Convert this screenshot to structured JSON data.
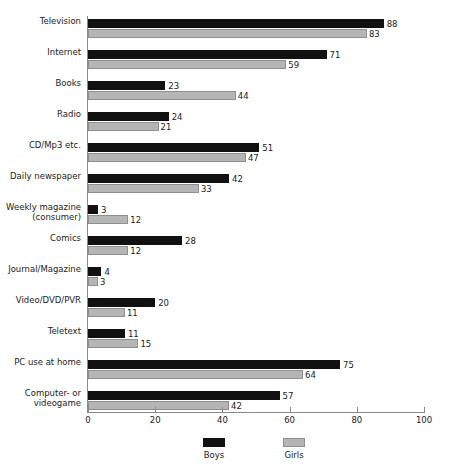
{
  "chart_data": {
    "type": "bar",
    "orientation": "horizontal",
    "title": "",
    "xlabel": "",
    "ylabel": "",
    "xlim": [
      0,
      100
    ],
    "xticks": [
      0,
      20,
      40,
      60,
      80,
      100
    ],
    "grid": false,
    "legend_position": "bottom",
    "categories": [
      "Television",
      "Internet",
      "Books",
      "Radio",
      "CD/Mp3 etc.",
      "Daily newspaper",
      "Weekly magazine\n(consumer)",
      "Comics",
      "Journal/Magazine",
      "Video/DVD/PVR",
      "Teletext",
      "PC use at home",
      "Computer- or\nvideogame"
    ],
    "series": [
      {
        "name": "Boys",
        "color": "#111111",
        "values": [
          88,
          71,
          23,
          24,
          51,
          42,
          3,
          28,
          4,
          20,
          11,
          75,
          57
        ]
      },
      {
        "name": "Girls",
        "color": "#b5b5b5",
        "values": [
          83,
          59,
          44,
          21,
          47,
          33,
          12,
          12,
          3,
          11,
          15,
          64,
          42
        ]
      }
    ]
  }
}
